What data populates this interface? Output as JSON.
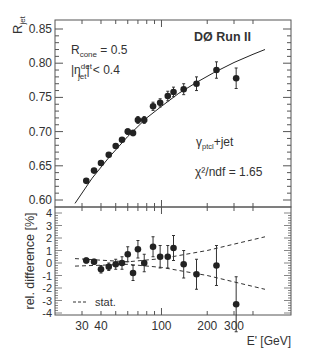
{
  "chart_data": [
    {
      "type": "scatter",
      "panel": "upper",
      "title": "DØ Run II",
      "xlabel": "E' [GeV]",
      "ylabel": "R_jet",
      "xscale": "log",
      "xlim": [
        25,
        500
      ],
      "ylim": [
        0.59,
        0.86
      ],
      "yticks": [
        "0.60",
        "0.65",
        "0.70",
        "0.75",
        "0.80",
        "0.85"
      ],
      "annotations": [
        "R_cone = 0.5",
        "|η_jet^det| < 0.4",
        "γ_ptcl+jet",
        "χ²/ndf = 1.65"
      ],
      "series": [
        {
          "name": "data",
          "x": [
            32,
            36,
            40,
            45,
            50,
            55,
            60,
            65,
            70,
            77,
            88,
            98,
            110,
            120,
            140,
            170,
            230,
            310
          ],
          "y": [
            0.628,
            0.643,
            0.654,
            0.666,
            0.679,
            0.688,
            0.7,
            0.698,
            0.717,
            0.717,
            0.737,
            0.742,
            0.752,
            0.758,
            0.762,
            0.77,
            0.79,
            0.778
          ],
          "err": [
            0.003,
            0.003,
            0.003,
            0.003,
            0.003,
            0.003,
            0.004,
            0.004,
            0.005,
            0.005,
            0.006,
            0.006,
            0.007,
            0.007,
            0.008,
            0.01,
            0.012,
            0.015
          ]
        },
        {
          "name": "fit",
          "x": [
            27,
            35,
            45,
            60,
            80,
            100,
            130,
            170,
            220,
            300,
            400,
            480
          ],
          "y": [
            0.595,
            0.632,
            0.662,
            0.693,
            0.72,
            0.737,
            0.756,
            0.772,
            0.786,
            0.801,
            0.813,
            0.82
          ]
        }
      ]
    },
    {
      "type": "scatter",
      "panel": "lower",
      "xlabel": "E' [GeV]",
      "ylabel": "rel. difference [%]",
      "xscale": "log",
      "xlim": [
        25,
        500
      ],
      "ylim": [
        -4.2,
        4.4
      ],
      "yticks": [
        "-4",
        "-3",
        "-2",
        "-1",
        "0",
        "1",
        "2",
        "3",
        "4"
      ],
      "xticks": [
        "30",
        "40",
        "100",
        "200",
        "300"
      ],
      "legend": [
        "stat."
      ],
      "series": [
        {
          "name": "data",
          "x": [
            32,
            36,
            40,
            45,
            50,
            55,
            60,
            65,
            70,
            77,
            88,
            98,
            110,
            120,
            140,
            170,
            230,
            310
          ],
          "y": [
            0.2,
            0.1,
            -0.5,
            -0.3,
            -0.1,
            0.0,
            0.7,
            -0.8,
            1.1,
            0.0,
            1.3,
            0.5,
            0.5,
            1.2,
            -0.1,
            -0.9,
            -0.2,
            -3.3
          ],
          "err": [
            0.2,
            0.2,
            0.3,
            0.3,
            0.4,
            0.5,
            0.6,
            0.6,
            0.7,
            0.7,
            0.8,
            0.9,
            0.9,
            1.0,
            1.1,
            1.2,
            1.6,
            2.2
          ]
        },
        {
          "name": "stat.",
          "x": [
            27,
            60,
            100,
            200,
            480
          ],
          "upper": [
            0.35,
            0.1,
            0.35,
            1.0,
            2.1
          ],
          "lower": [
            -0.25,
            -0.1,
            -0.35,
            -1.0,
            -2.1
          ]
        }
      ]
    }
  ],
  "labels": {
    "title": "DØ Run II",
    "ylabel_top_main": "R",
    "ylabel_top_sub": "jet",
    "rcone_main": "R",
    "rcone_sub": "cone",
    "rcone_val": " = 0.5",
    "eta_main": "|η",
    "eta_sup": "det",
    "eta_sub": "jet",
    "eta_rest": "| < 0.4",
    "gamma_main": "γ",
    "gamma_sub": "ptcl",
    "gamma_rest": "+jet",
    "chi2": "χ²/ndf = 1.65",
    "ylabel_bottom": "rel. difference [%]",
    "xlabel": "E' [GeV]",
    "legend_stat": "stat.",
    "yticks_top": [
      "0.60",
      "0.65",
      "0.70",
      "0.75",
      "0.80",
      "0.85"
    ],
    "yticks_bottom": [
      "4",
      "3",
      "2",
      "1",
      "0",
      "-1",
      "-2",
      "-3",
      "-4"
    ],
    "xticks": [
      "30",
      "40",
      "100",
      "200",
      "300"
    ]
  }
}
